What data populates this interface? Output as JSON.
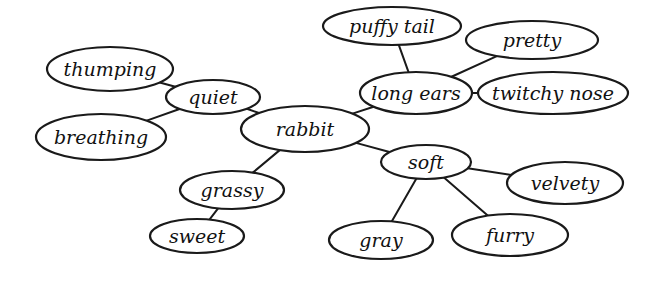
{
  "diagram": {
    "type": "concept-map",
    "center": "rabbit",
    "colors": {
      "stroke": "#1a1a1a",
      "text": "#111111",
      "background": "#ffffff"
    },
    "nodes": [
      {
        "id": "thumping",
        "label": "thumping",
        "cx": 110,
        "cy": 69,
        "rx": 63,
        "ry": 22
      },
      {
        "id": "quiet",
        "label": "quiet",
        "cx": 213,
        "cy": 97,
        "rx": 47,
        "ry": 17
      },
      {
        "id": "breathing",
        "label": "breathing",
        "cx": 101,
        "cy": 137,
        "rx": 65,
        "ry": 23
      },
      {
        "id": "rabbit",
        "label": "rabbit",
        "cx": 305,
        "cy": 129,
        "rx": 64,
        "ry": 23
      },
      {
        "id": "grassy",
        "label": "grassy",
        "cx": 232,
        "cy": 190,
        "rx": 52,
        "ry": 19
      },
      {
        "id": "sweet",
        "label": "sweet",
        "cx": 197,
        "cy": 236,
        "rx": 47,
        "ry": 17
      },
      {
        "id": "puffy_tail",
        "label": "puffy tail",
        "cx": 392,
        "cy": 26,
        "rx": 69,
        "ry": 19
      },
      {
        "id": "pretty",
        "label": "pretty",
        "cx": 532,
        "cy": 40,
        "rx": 66,
        "ry": 19
      },
      {
        "id": "long_ears",
        "label": "long ears",
        "cx": 416,
        "cy": 93,
        "rx": 56,
        "ry": 21
      },
      {
        "id": "twitchy_nose",
        "label": "twitchy nose",
        "cx": 553,
        "cy": 93,
        "rx": 75,
        "ry": 21
      },
      {
        "id": "soft",
        "label": "soft",
        "cx": 426,
        "cy": 162,
        "rx": 45,
        "ry": 17
      },
      {
        "id": "velvety",
        "label": "velvety",
        "cx": 565,
        "cy": 183,
        "rx": 58,
        "ry": 21
      },
      {
        "id": "gray",
        "label": "gray",
        "cx": 381,
        "cy": 240,
        "rx": 52,
        "ry": 19
      },
      {
        "id": "furry",
        "label": "furry",
        "cx": 510,
        "cy": 235,
        "rx": 58,
        "ry": 21
      }
    ],
    "edges": [
      [
        "thumping",
        "quiet"
      ],
      [
        "breathing",
        "quiet"
      ],
      [
        "quiet",
        "rabbit"
      ],
      [
        "rabbit",
        "grassy"
      ],
      [
        "grassy",
        "sweet"
      ],
      [
        "rabbit",
        "long_ears"
      ],
      [
        "long_ears",
        "puffy_tail"
      ],
      [
        "long_ears",
        "pretty"
      ],
      [
        "long_ears",
        "twitchy_nose"
      ],
      [
        "rabbit",
        "soft"
      ],
      [
        "soft",
        "velvety"
      ],
      [
        "soft",
        "gray"
      ],
      [
        "soft",
        "furry"
      ]
    ]
  }
}
